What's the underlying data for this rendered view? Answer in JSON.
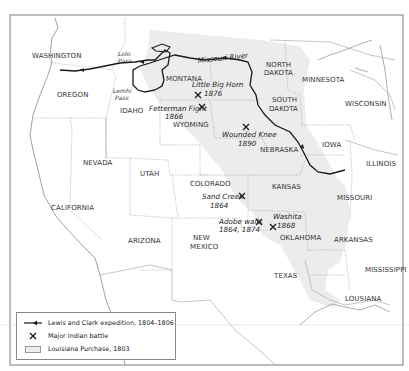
{
  "map": {
    "states": [
      {
        "name": "WASHINGTON",
        "x": 32,
        "y": 58
      },
      {
        "name": "OREGON",
        "x": 57,
        "y": 97
      },
      {
        "name": "IDAHO",
        "x": 120,
        "y": 113
      },
      {
        "name": "MONTANA",
        "x": 166,
        "y": 81
      },
      {
        "name": "WYOMING",
        "x": 173,
        "y": 127
      },
      {
        "name": "NORTH",
        "x": 266,
        "y": 67
      },
      {
        "name": "DAKOTA",
        "x": 264,
        "y": 75
      },
      {
        "name": "SOUTH",
        "x": 272,
        "y": 102
      },
      {
        "name": "DAKOTA",
        "x": 269,
        "y": 111
      },
      {
        "name": "MINNESOTA",
        "x": 302,
        "y": 82
      },
      {
        "name": "WISCONSIN",
        "x": 345,
        "y": 106
      },
      {
        "name": "NEBRASKA",
        "x": 260,
        "y": 152
      },
      {
        "name": "IOWA",
        "x": 322,
        "y": 147
      },
      {
        "name": "ILLINOIS",
        "x": 366,
        "y": 166
      },
      {
        "name": "NEVADA",
        "x": 83,
        "y": 165
      },
      {
        "name": "UTAH",
        "x": 140,
        "y": 176
      },
      {
        "name": "COLORADO",
        "x": 190,
        "y": 186
      },
      {
        "name": "KANSAS",
        "x": 272,
        "y": 189
      },
      {
        "name": "MISSOURI",
        "x": 337,
        "y": 200
      },
      {
        "name": "CALIFORNIA",
        "x": 51,
        "y": 210
      },
      {
        "name": "ARIZONA",
        "x": 128,
        "y": 243
      },
      {
        "name": "NEW",
        "x": 193,
        "y": 240
      },
      {
        "name": "MEXICO",
        "x": 190,
        "y": 249
      },
      {
        "name": "OKLAHOMA",
        "x": 280,
        "y": 240
      },
      {
        "name": "ARKANSAS",
        "x": 334,
        "y": 242
      },
      {
        "name": "TEXAS",
        "x": 274,
        "y": 278
      },
      {
        "name": "MISSISSIPPI",
        "x": 365,
        "y": 272
      },
      {
        "name": "LOUSIANA",
        "x": 345,
        "y": 301
      }
    ],
    "passes": [
      {
        "line1": "Lolo",
        "line2": "Pass",
        "x": 118,
        "y": 56
      },
      {
        "line1": "Lemhi",
        "line2": "Pass",
        "x": 113,
        "y": 93
      }
    ],
    "river": {
      "label": "Missouri River",
      "x": 198,
      "y": 63
    },
    "battles": [
      {
        "name": "Little Big Horn",
        "year": "1876",
        "label_x": 192,
        "label_y": 87,
        "year_x": 203,
        "year_y": 96,
        "mark_x": 198,
        "mark_y": 95
      },
      {
        "name": "Fetterman Fight",
        "year": "1866",
        "label_x": 150,
        "label_y": 111,
        "year_x": 165,
        "year_y": 119,
        "mark_x": 202,
        "mark_y": 107
      },
      {
        "name": "Wounded Knee",
        "year": "1890",
        "label_x": 222,
        "label_y": 137,
        "year_x": 240,
        "year_y": 146,
        "mark_x": 246,
        "mark_y": 127
      },
      {
        "name": "Sand Creek",
        "year": "1864",
        "label_x": 202,
        "label_y": 199,
        "year_x": 210,
        "year_y": 208,
        "mark_x": 242,
        "mark_y": 196
      },
      {
        "name": "Adobe walls",
        "year": "1864, 1874",
        "label_x": 220,
        "label_y": 224,
        "year_x": 220,
        "year_y": 232,
        "mark_x": 259,
        "mark_y": 222
      },
      {
        "name": "Washita",
        "year": "1868",
        "label_x": 273,
        "label_y": 219,
        "year_x": 276,
        "year_y": 228,
        "mark_x": 273,
        "mark_y": 227
      }
    ]
  },
  "legend": {
    "items": [
      {
        "symbol": "route-arrow",
        "label": "Lewis and Clark expedition, 1804–1806"
      },
      {
        "symbol": "crossed-swords",
        "label": "Major Indian battle"
      },
      {
        "symbol": "shaded-swatch",
        "label": "Louisiana Purchase, 1803"
      }
    ]
  },
  "colors": {
    "purchase_fill": "#ececec",
    "route": "#1a1a1a",
    "border": "#9a9a9a",
    "frame": "#7a7a7a"
  }
}
